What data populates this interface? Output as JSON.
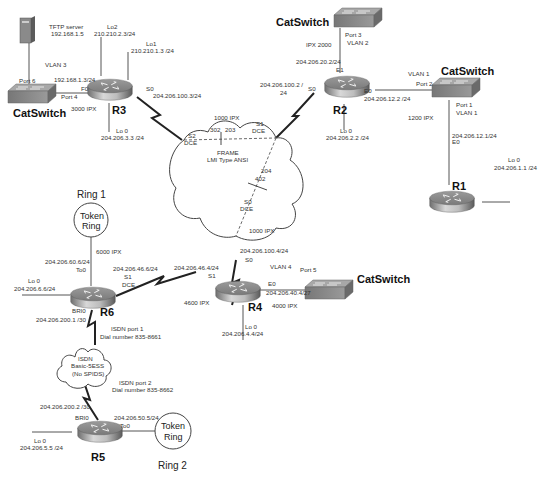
{
  "diagram": {
    "type": "network-topology",
    "routers": [
      {
        "id": "R1",
        "label": "R1"
      },
      {
        "id": "R2",
        "label": "R2"
      },
      {
        "id": "R3",
        "label": "R3"
      },
      {
        "id": "R4",
        "label": "R4"
      },
      {
        "id": "R5",
        "label": "R5"
      },
      {
        "id": "R6",
        "label": "R6"
      }
    ],
    "switches": {
      "sw_r3": {
        "label": "CatSwitch",
        "port_a": "Port 6",
        "port_b": "Port 4",
        "vlan": "VLAN 3"
      },
      "sw_r2": {
        "label": "CatSwitch",
        "port": "Port 3",
        "vlan": "VLAN 2"
      },
      "sw_r1": {
        "label": "CatSwitch",
        "port_up": "Port 2",
        "vlan_up": "VLAN 1",
        "port_down": "Port 1",
        "vlan_down": "VLAN 1"
      },
      "sw_r4": {
        "label": "CatSwitch",
        "port": "Port 5"
      }
    },
    "tftp": {
      "label": "TFTP server",
      "ip": "192.168.1.5"
    },
    "r3": {
      "lo2_name": "Lo2",
      "lo2_ip": "210.210.2.3/24",
      "lo1_name": "Lo1",
      "lo1_ip": "210.210.1.3 /24",
      "f0_ip": "192.168.1.3/24",
      "f0_name": "F0",
      "ipx": "3000 IPX",
      "s0_name": "S0",
      "s0_ip": "204.206.100.3/24",
      "lo0_name": "Lo 0",
      "lo0_ip": "204.206.3.3 /24"
    },
    "r2": {
      "ipx_e1": "IPX 2000",
      "e1_ip": "204.206.20.2/24",
      "e1_name": "E1",
      "s0_ip_a": "204.206.100.2 /",
      "s0_ip_b": "24",
      "s0_name": "S0",
      "e0_name": "E0",
      "e0_ip": "204.206.12.2 /24",
      "lo0_name": "Lo 0",
      "lo0_ip": "204.206.2.2 /24"
    },
    "r1": {
      "ipx": "1200 IPX",
      "e0_ip": "204.206.12.1/24",
      "e0_name": "E0",
      "lo0_name": "Lo 0",
      "lo0_ip": "204.206.1.1 /24"
    },
    "frame": {
      "title": "FRAME",
      "subtitle": "LMI Type ANSI",
      "ipx": "1000 IPX",
      "dlci_302": "302",
      "dlci_203": "203",
      "dlci_204": "204",
      "dlci_402": "402",
      "s2": "S2",
      "s2_dce": "DCE",
      "s1": "S1",
      "s1_dce": "DCE",
      "s0": "S0",
      "s0_dce": "DCE"
    },
    "r4": {
      "ipx_s0": "1000 IPX",
      "s0_ip": "204.206.100.4/24",
      "s0_name": "S0",
      "s1_ip": "204.206.46.4/24",
      "s1_name": "S1",
      "vlan": "VLAN 4",
      "e0_name": "E0",
      "e0_ip": "204.206.40.4/27",
      "ipx_s1": "4600 IPX",
      "ipx_e0": "4000 IPX",
      "lo0_name": "Lo 0",
      "lo0_ip": "204.206.4.4/24"
    },
    "r6": {
      "ipx_to0": "6000 IPX",
      "to0_ip": "204.206.60.6/24",
      "to0_name": "To0",
      "s1_ip": "204.206.46.6/24",
      "s1_name": "S1",
      "s1_dce": "DCE",
      "lo0_name": "Lo 0",
      "lo0_ip": "204.206.6.6/24",
      "bri_name": "BRI0",
      "bri_ip": "204.206.200.1 /30",
      "isdn_port": "ISDN port 1",
      "dial": "Dial number 835-8661"
    },
    "isdn": {
      "line1": "ISDN",
      "line2": "Basic-5ESS",
      "line3": "(No SPIDS)"
    },
    "r5": {
      "isdn_port": "ISDN port 2",
      "dial": "Dial number 835-8662",
      "bri_ip": "204.206.200.2 /30",
      "bri_name": "BRI0",
      "to0_ip": "204.206.50.5/24",
      "to0_name": "To0",
      "lo0_name": "Lo 0",
      "lo0_ip": "204.206.5.5 /24"
    },
    "rings": {
      "ring1": {
        "title": "Ring 1",
        "line1": "Token",
        "line2": "Ring"
      },
      "ring2": {
        "title": "Ring 2",
        "line1": "Token",
        "line2": "Ring"
      }
    }
  }
}
